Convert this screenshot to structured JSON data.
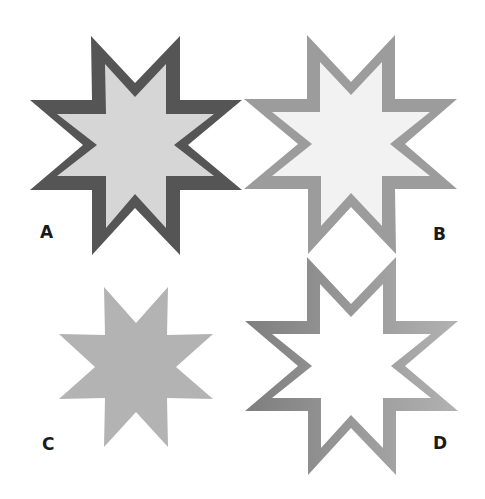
{
  "figure": {
    "panels": [
      {
        "id": "A",
        "label": "A",
        "style": "dark outline, light gray fill",
        "stroke": "#555555",
        "fill": "#d6d6d6"
      },
      {
        "id": "B",
        "label": "B",
        "style": "medium gray outline, near-white fill",
        "stroke": "#9c9c9c",
        "fill": "#f2f2f2"
      },
      {
        "id": "C",
        "label": "C",
        "style": "solid gray fill, no outline",
        "fill": "#b3b3b3"
      },
      {
        "id": "D",
        "label": "D",
        "style": "gradient gray outline, white fill",
        "stroke_start": "#808080",
        "stroke_end": "#b0b0b0",
        "fill": "#ffffff"
      }
    ],
    "shape": "eight-pointed star"
  }
}
